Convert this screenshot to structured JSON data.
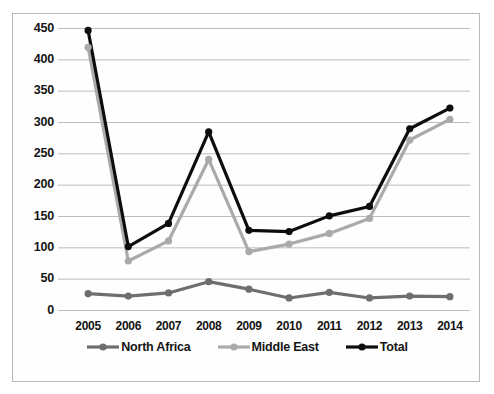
{
  "figure": {
    "caption_partial": ""
  },
  "legend": {
    "position": "bottom-center",
    "entries": [
      {
        "label": "North Africa",
        "color": "#6e6e6e"
      },
      {
        "label": "Middle East",
        "color": "#aaaaaa"
      },
      {
        "label": "Total",
        "color": "#0d0d0d"
      }
    ]
  },
  "chart_data": {
    "type": "line",
    "title": "",
    "xlabel": "",
    "ylabel": "ODA Disbursements in Millions (USD)",
    "categories": [
      "2005",
      "2006",
      "2007",
      "2008",
      "2009",
      "2010",
      "2011",
      "2012",
      "2013",
      "2014"
    ],
    "x": [
      2005,
      2006,
      2007,
      2008,
      2009,
      2010,
      2011,
      2012,
      2013,
      2014
    ],
    "ylim": [
      0,
      450
    ],
    "yticks": [
      0,
      50,
      100,
      150,
      200,
      250,
      300,
      350,
      400,
      450
    ],
    "ytick_labels": [
      "0",
      "50",
      "100",
      "150",
      "200",
      "250",
      "300",
      "350",
      "400",
      "450"
    ],
    "grid": true,
    "grid_axis": "y",
    "series": [
      {
        "name": "North Africa",
        "color": "#6e6e6e",
        "values": [
          27,
          23,
          28,
          46,
          34,
          20,
          29,
          20,
          23,
          22
        ]
      },
      {
        "name": "Middle East",
        "color": "#aaaaaa",
        "values": [
          420,
          79,
          111,
          241,
          94,
          106,
          123,
          147,
          272,
          305
        ]
      },
      {
        "name": "Total",
        "color": "#0d0d0d",
        "values": [
          447,
          102,
          139,
          285,
          128,
          126,
          151,
          166,
          290,
          323
        ]
      }
    ]
  }
}
